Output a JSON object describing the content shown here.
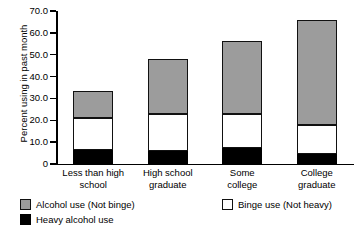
{
  "chart_data": {
    "type": "bar",
    "stacked": true,
    "title": "",
    "xlabel": "",
    "ylabel": "Percent using in past month",
    "ylim": [
      0,
      70
    ],
    "ytick_labels": [
      "70.0",
      "60.0",
      "50.0",
      "40.0",
      "30.0",
      "20.0",
      "10.0",
      "0"
    ],
    "ytick_values": [
      70,
      60,
      50,
      40,
      30,
      20,
      10,
      0
    ],
    "grid": false,
    "legend_position": "bottom",
    "categories": [
      "Less than high school",
      "High school graduate",
      "Some college",
      "College graduate"
    ],
    "category_lines": [
      [
        "Less than high",
        "school"
      ],
      [
        "High school",
        "graduate"
      ],
      [
        "Some",
        "college"
      ],
      [
        "College",
        "graduate"
      ]
    ],
    "series": [
      {
        "name": "Heavy alcohol use",
        "color": "#000000",
        "values": [
          6.6,
          6.0,
          7.5,
          4.5
        ]
      },
      {
        "name": "Binge use (Not heavy)",
        "color": "#ffffff",
        "values": [
          14.4,
          17.0,
          15.5,
          13.5
        ]
      },
      {
        "name": "Alcohol use (Not binge)",
        "color": "#9c9c9c",
        "values": [
          12.6,
          25.0,
          33.5,
          48.0
        ]
      }
    ],
    "stack_tops": {
      "heavy": [
        6.6,
        6.0,
        7.5,
        4.5
      ],
      "heavy_plus_binge": [
        21.0,
        23.0,
        23.0,
        18.0
      ],
      "total": [
        33.6,
        48.0,
        56.5,
        66.0
      ]
    }
  },
  "legend": {
    "items": [
      {
        "label": "Alcohol use (Not binge)",
        "swatch": "gray"
      },
      {
        "label": "Binge use (Not heavy)",
        "swatch": "white"
      },
      {
        "label": "Heavy alcohol use",
        "swatch": "black"
      }
    ]
  }
}
